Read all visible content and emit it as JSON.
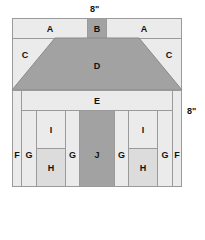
{
  "diagram": {
    "type": "quilt-block-layout",
    "top_dimension": "8\"",
    "side_dimension": "8\"",
    "pieces": {
      "A_left": "A",
      "B": "B",
      "A_right": "A",
      "C_left": "C",
      "D": "D",
      "C_right": "C",
      "E": "E",
      "F_left": "F",
      "G1": "G",
      "I_left": "I",
      "H_left": "H",
      "G2": "G",
      "J": "J",
      "G3": "G",
      "I_right": "I",
      "H_right": "H",
      "G4": "G",
      "F_right": "F"
    },
    "colors": {
      "light": "#ebebeb",
      "mid": "#dcdcdc",
      "dark": "#a2a2a2",
      "outline": "#9a9a9a"
    }
  }
}
